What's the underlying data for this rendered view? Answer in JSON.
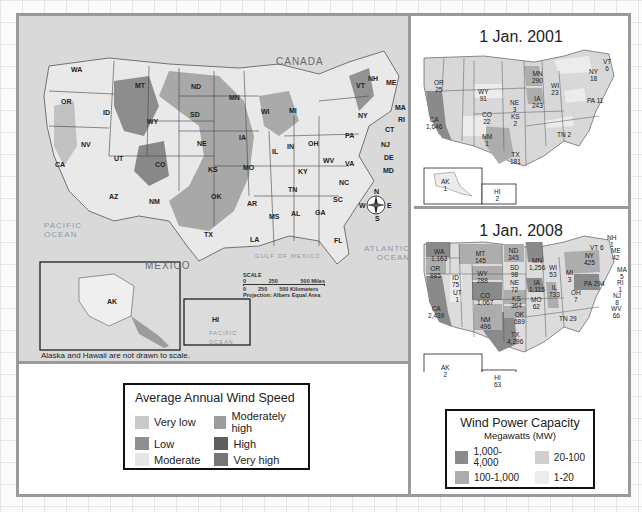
{
  "main_map": {
    "country_labels": {
      "canada": "CANADA",
      "mexico": "MEXICO"
    },
    "water_labels": {
      "pacific": "PACIFIC\nOCEAN",
      "atlantic": "ATLANTIC\nOCEAN",
      "gulf": "GULF OF MEXICO"
    },
    "state_labels": [
      "WA",
      "OR",
      "CA",
      "NV",
      "ID",
      "MT",
      "WY",
      "UT",
      "AZ",
      "CO",
      "NM",
      "ND",
      "SD",
      "NE",
      "KS",
      "OK",
      "TX",
      "MN",
      "IA",
      "MO",
      "AR",
      "LA",
      "WI",
      "IL",
      "MI",
      "IN",
      "OH",
      "KY",
      "TN",
      "MS",
      "AL",
      "GA",
      "FL",
      "SC",
      "NC",
      "VA",
      "WV",
      "PA",
      "NY",
      "VT",
      "NH",
      "ME",
      "MA",
      "RI",
      "CT",
      "NJ",
      "DE",
      "MD"
    ],
    "compass": {
      "n": "N",
      "s": "S",
      "e": "E",
      "w": "W"
    },
    "scale": {
      "title": "SCALE",
      "miles": [
        "0",
        "250",
        "500 Miles"
      ],
      "km": [
        "0",
        "250",
        "500 Kilometers"
      ],
      "projection": "Projection: Albers Equal Area"
    },
    "inset_alaska": "AK",
    "inset_hawaii": "HI",
    "inset_hawaii_ocean": "PACIFIC\nOCEAN",
    "note": "Alaska and Hawaii are not drawn to scale."
  },
  "wind_speed_legend": {
    "title": "Average Annual Wind Speed",
    "items": [
      {
        "label": "Very low",
        "color": "#c9c9c9"
      },
      {
        "label": "Moderately high",
        "color": "#9c9c9c"
      },
      {
        "label": "Low",
        "color": "#8f8f8f"
      },
      {
        "label": "High",
        "color": "#5e5e5e"
      },
      {
        "label": "Moderate",
        "color": "#e6e6e6"
      },
      {
        "label": "Very high",
        "color": "#767676"
      }
    ]
  },
  "map_2001": {
    "title": "1 Jan. 2001",
    "states": [
      {
        "state": "OR",
        "value": "25"
      },
      {
        "state": "CA",
        "value": "1,646"
      },
      {
        "state": "WY",
        "value": "91"
      },
      {
        "state": "CO",
        "value": "22"
      },
      {
        "state": "NM",
        "value": "1"
      },
      {
        "state": "TX",
        "value": "181"
      },
      {
        "state": "NE",
        "value": "3"
      },
      {
        "state": "KS",
        "value": "2"
      },
      {
        "state": "MN",
        "value": "290"
      },
      {
        "state": "IA",
        "value": "243"
      },
      {
        "state": "WI",
        "value": "23"
      },
      {
        "state": "NY",
        "value": "18"
      },
      {
        "state": "VT",
        "value": "6"
      },
      {
        "state": "PA",
        "value": "11"
      },
      {
        "state": "TN",
        "value": "2"
      },
      {
        "state": "AK",
        "value": "1"
      },
      {
        "state": "HI",
        "value": "2"
      }
    ]
  },
  "map_2008": {
    "title": "1 Jan. 2008",
    "states": [
      {
        "state": "WA",
        "value": "1,163"
      },
      {
        "state": "OR",
        "value": "885"
      },
      {
        "state": "CA",
        "value": "2,439"
      },
      {
        "state": "ID",
        "value": "75"
      },
      {
        "state": "UT",
        "value": "1"
      },
      {
        "state": "MT",
        "value": "145"
      },
      {
        "state": "WY",
        "value": "288"
      },
      {
        "state": "CO",
        "value": "1,067"
      },
      {
        "state": "NM",
        "value": "496"
      },
      {
        "state": "ND",
        "value": "345"
      },
      {
        "state": "SD",
        "value": "98"
      },
      {
        "state": "NE",
        "value": "72"
      },
      {
        "state": "KS",
        "value": "364"
      },
      {
        "state": "OK",
        "value": "689"
      },
      {
        "state": "TX",
        "value": "4,296"
      },
      {
        "state": "MN",
        "value": "1,256"
      },
      {
        "state": "IA",
        "value": "1,115"
      },
      {
        "state": "MO",
        "value": "62"
      },
      {
        "state": "WI",
        "value": "53"
      },
      {
        "state": "IL",
        "value": "733"
      },
      {
        "state": "MI",
        "value": "3"
      },
      {
        "state": "OH",
        "value": "7"
      },
      {
        "state": "TN",
        "value": "29"
      },
      {
        "state": "PA",
        "value": "294"
      },
      {
        "state": "NY",
        "value": "425"
      },
      {
        "state": "VT",
        "value": "6"
      },
      {
        "state": "NH",
        "value": "1"
      },
      {
        "state": "ME",
        "value": "42"
      },
      {
        "state": "MA",
        "value": "5"
      },
      {
        "state": "RI",
        "value": "1"
      },
      {
        "state": "NJ",
        "value": "8"
      },
      {
        "state": "WV",
        "value": "66"
      },
      {
        "state": "AK",
        "value": "2"
      },
      {
        "state": "HI",
        "value": "63"
      }
    ]
  },
  "capacity_legend": {
    "title": "Wind Power Capacity",
    "subtitle": "Megawatts (MW)",
    "items": [
      {
        "label": "1,000-4,000",
        "color": "#8a8a8a"
      },
      {
        "label": "20-100",
        "color": "#cfcfcf"
      },
      {
        "label": "100-1,000",
        "color": "#adadad"
      },
      {
        "label": "1-20",
        "color": "#ececec"
      }
    ]
  }
}
